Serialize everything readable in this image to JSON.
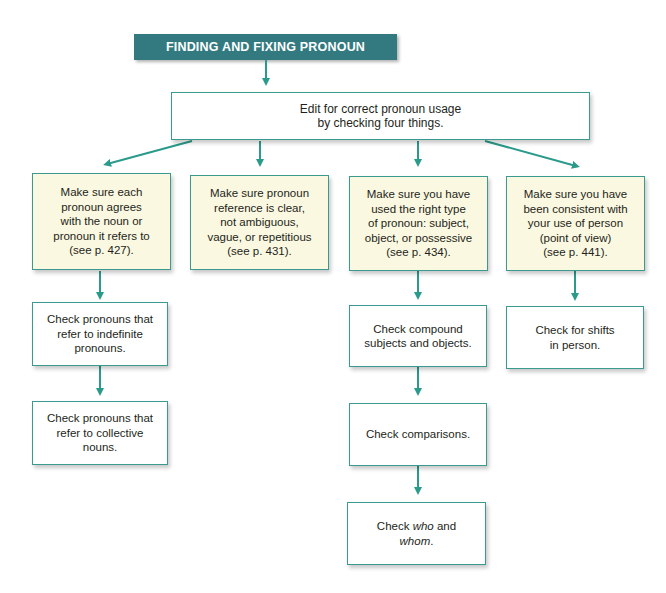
{
  "title": "FINDING AND FIXING PRONOUN PROBLEMS",
  "colors": {
    "title_bg": "#327a80",
    "box_border": "#3a9a90",
    "arrow": "#2a9a8a",
    "cream_fill": "#fbf8e1"
  },
  "root": {
    "text": "Edit for correct pronoun usage\nby checking four things."
  },
  "columns": [
    {
      "main": "Make sure each\npronoun agrees\nwith the noun or\npronoun it refers to\n(see p. 427).",
      "steps": [
        "Check pronouns that\nrefer to indefinite\npronouns.",
        "Check pronouns that\nrefer to collective\nnouns."
      ]
    },
    {
      "main": "Make sure pronoun\nreference is clear,\nnot ambiguous,\nvague, or repetitious\n(see p. 431).",
      "steps": []
    },
    {
      "main": "Make sure you have\nused the right type\nof pronoun: subject,\nobject, or possessive\n(see p. 434).",
      "steps": [
        "Check compound\nsubjects and objects.",
        "Check comparisons.",
        "Check who and\nwhom."
      ]
    },
    {
      "main": "Make sure you have\nbeen consistent with\nyour use of person\n(point of view)\n(see p. 441).",
      "steps": [
        "Check for shifts\nin person."
      ]
    }
  ]
}
